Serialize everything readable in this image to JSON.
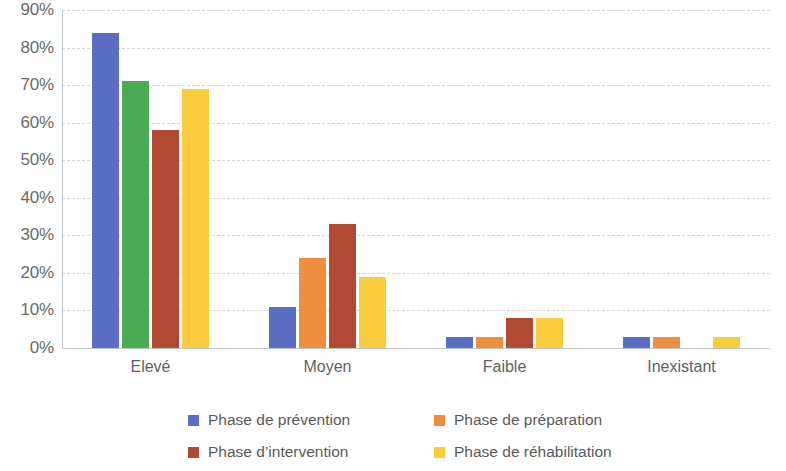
{
  "chart_data": {
    "type": "bar",
    "title": "",
    "subtitle": "",
    "xlabel": "",
    "ylabel": "",
    "grid": true,
    "legend_position": "bottom",
    "ylim": [
      0,
      90
    ],
    "ytick_labels": [
      "90%",
      "80%",
      "70%",
      "60%",
      "50%",
      "40%",
      "30%",
      "20%",
      "10%",
      "0%"
    ],
    "ytick_values": [
      90,
      80,
      70,
      60,
      50,
      40,
      30,
      20,
      10,
      0
    ],
    "categories": [
      "Elevé",
      "Moyen",
      "Faible",
      "Inexistant"
    ],
    "series": [
      {
        "name": "Phase de prévention",
        "color": "#5b6ec4",
        "values": [
          84,
          11,
          3,
          3
        ],
        "bar_colors": [
          "#5b6ec4",
          "#5b6ec4",
          "#5b6ec4",
          "#5b6ec4"
        ]
      },
      {
        "name": "Phase de préparation",
        "color": "#ef8e3e",
        "values": [
          71,
          24,
          3,
          3
        ],
        "bar_colors": [
          "#4aab52",
          "#ef8e3e",
          "#ef8e3e",
          "#ef8e3e"
        ]
      },
      {
        "name": "Phase d’intervention",
        "color": "#b04a32",
        "values": [
          58,
          33,
          8,
          0
        ],
        "bar_colors": [
          "#b04a32",
          "#b04a32",
          "#b04a32",
          "#b04a32"
        ]
      },
      {
        "name": "Phase de réhabilitation",
        "color": "#fbcc3d",
        "values": [
          69,
          19,
          8,
          3
        ],
        "bar_colors": [
          "#fbcc3d",
          "#fbcc3d",
          "#fbcc3d",
          "#fbcc3d"
        ]
      }
    ]
  },
  "legend": {
    "items": [
      {
        "label": "Phase de prévention",
        "color": "#5b6ec4"
      },
      {
        "label": "Phase de préparation",
        "color": "#ef8e3e"
      },
      {
        "label": "Phase d’intervention",
        "color": "#b04a32"
      },
      {
        "label": "Phase de réhabilitation",
        "color": "#fbcc3d"
      }
    ]
  },
  "colors": {
    "gridline": "#c9cdd4",
    "axis": "#c2c6cd",
    "text": "#5f5f5f",
    "background": "#ffffff"
  }
}
